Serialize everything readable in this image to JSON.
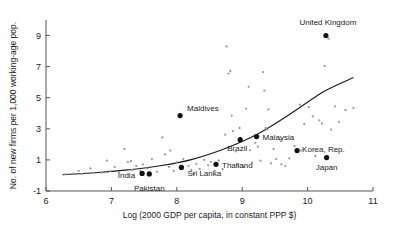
{
  "chart_data": {
    "type": "scatter",
    "title": "",
    "xlabel": "Log (2000 GDP per capita, in constant PPP $)",
    "ylabel": "No. of new firms per 1,000 working-age pop.",
    "xlim": [
      6,
      11
    ],
    "ylim": [
      -1,
      10
    ],
    "xticks": [
      6,
      7,
      8,
      9,
      10,
      11
    ],
    "yticks": [
      -1,
      1,
      3,
      5,
      7,
      9
    ],
    "xtick_labels": [
      "6",
      "7",
      "8",
      "9",
      "10",
      "11"
    ],
    "ytick_labels": [
      "-1",
      "1",
      "3",
      "5",
      "7",
      "9"
    ],
    "grid": false,
    "legend": "none",
    "labeled_points": [
      {
        "name": "United Kingdom",
        "x": 10.28,
        "y": 9.0,
        "label_dx": 2,
        "label_dy": -11,
        "anchor": "middle"
      },
      {
        "name": "Maldives",
        "x": 8.05,
        "y": 3.85,
        "label_dx": 7,
        "label_dy": -5,
        "anchor": "start"
      },
      {
        "name": "Malaysia",
        "x": 9.22,
        "y": 2.5,
        "label_dx": 6,
        "label_dy": 3,
        "anchor": "start"
      },
      {
        "name": "Brazil",
        "x": 8.97,
        "y": 2.3,
        "label_dx": -3,
        "label_dy": 11,
        "anchor": "middle"
      },
      {
        "name": "Korea, Rep.",
        "x": 9.84,
        "y": 1.6,
        "label_dx": 5,
        "label_dy": 1,
        "anchor": "start"
      },
      {
        "name": "Japan",
        "x": 10.29,
        "y": 1.15,
        "label_dx": 0,
        "label_dy": 12,
        "anchor": "middle"
      },
      {
        "name": "Thailand",
        "x": 8.6,
        "y": 0.72,
        "label_dx": 6,
        "label_dy": 4,
        "anchor": "start"
      },
      {
        "name": "Sri Lanka",
        "x": 8.07,
        "y": 0.52,
        "label_dx": 6,
        "label_dy": 9,
        "anchor": "start"
      },
      {
        "name": "India",
        "x": 7.47,
        "y": 0.13,
        "label_dx": -7,
        "label_dy": 5,
        "anchor": "end"
      },
      {
        "name": "Pakistan",
        "x": 7.58,
        "y": 0.1,
        "label_dx": 0,
        "label_dy": 17,
        "anchor": "middle"
      }
    ],
    "grey_points": [
      {
        "x": 6.3,
        "y": 0.08
      },
      {
        "x": 6.42,
        "y": 0.12
      },
      {
        "x": 6.5,
        "y": 0.3
      },
      {
        "x": 6.55,
        "y": 0.1
      },
      {
        "x": 6.68,
        "y": 0.45
      },
      {
        "x": 6.72,
        "y": 0.15
      },
      {
        "x": 6.85,
        "y": 0.18
      },
      {
        "x": 6.93,
        "y": 0.95
      },
      {
        "x": 6.98,
        "y": 0.28
      },
      {
        "x": 7.05,
        "y": 0.55
      },
      {
        "x": 7.12,
        "y": 0.2
      },
      {
        "x": 7.2,
        "y": 1.7
      },
      {
        "x": 7.25,
        "y": 0.85
      },
      {
        "x": 7.3,
        "y": 0.92
      },
      {
        "x": 7.32,
        "y": 0.35
      },
      {
        "x": 7.38,
        "y": 0.62
      },
      {
        "x": 7.44,
        "y": 0.3
      },
      {
        "x": 7.55,
        "y": 0.45
      },
      {
        "x": 7.62,
        "y": 1.05
      },
      {
        "x": 7.7,
        "y": 0.25
      },
      {
        "x": 7.78,
        "y": 2.45
      },
      {
        "x": 7.82,
        "y": 1.35
      },
      {
        "x": 7.88,
        "y": 0.55
      },
      {
        "x": 7.95,
        "y": 0.3
      },
      {
        "x": 8.0,
        "y": 0.85
      },
      {
        "x": 8.1,
        "y": 1.05
      },
      {
        "x": 8.18,
        "y": 0.6
      },
      {
        "x": 8.22,
        "y": 0.35
      },
      {
        "x": 8.3,
        "y": 0.75
      },
      {
        "x": 8.35,
        "y": 0.42
      },
      {
        "x": 8.42,
        "y": 1.0
      },
      {
        "x": 8.48,
        "y": 0.65
      },
      {
        "x": 8.52,
        "y": 0.88
      },
      {
        "x": 8.58,
        "y": 0.3
      },
      {
        "x": 8.64,
        "y": 0.95
      },
      {
        "x": 8.7,
        "y": 0.4
      },
      {
        "x": 8.74,
        "y": 2.62
      },
      {
        "x": 8.76,
        "y": 8.3
      },
      {
        "x": 8.79,
        "y": 6.55
      },
      {
        "x": 8.82,
        "y": 6.72
      },
      {
        "x": 8.84,
        "y": 3.85
      },
      {
        "x": 8.86,
        "y": 2.85
      },
      {
        "x": 8.9,
        "y": 1.55
      },
      {
        "x": 8.92,
        "y": 0.7
      },
      {
        "x": 8.96,
        "y": 3.05
      },
      {
        "x": 9.02,
        "y": 0.55
      },
      {
        "x": 9.06,
        "y": 4.3
      },
      {
        "x": 9.1,
        "y": 5.7
      },
      {
        "x": 9.12,
        "y": 1.62
      },
      {
        "x": 9.15,
        "y": 0.82
      },
      {
        "x": 9.2,
        "y": 2.1
      },
      {
        "x": 9.24,
        "y": 1.85
      },
      {
        "x": 9.28,
        "y": 0.95
      },
      {
        "x": 9.32,
        "y": 6.65
      },
      {
        "x": 9.34,
        "y": 5.45
      },
      {
        "x": 9.36,
        "y": 3.05
      },
      {
        "x": 9.38,
        "y": 2.95
      },
      {
        "x": 9.4,
        "y": 4.25
      },
      {
        "x": 9.44,
        "y": 0.78
      },
      {
        "x": 9.48,
        "y": 1.7
      },
      {
        "x": 9.52,
        "y": 1.05
      },
      {
        "x": 9.58,
        "y": 2.3
      },
      {
        "x": 9.66,
        "y": 0.6
      },
      {
        "x": 9.72,
        "y": 1.1
      },
      {
        "x": 9.8,
        "y": 1.9
      },
      {
        "x": 9.88,
        "y": 4.55
      },
      {
        "x": 9.95,
        "y": 3.3
      },
      {
        "x": 10.02,
        "y": 4.4
      },
      {
        "x": 10.08,
        "y": 3.8
      },
      {
        "x": 10.12,
        "y": 1.25
      },
      {
        "x": 10.18,
        "y": 3.55
      },
      {
        "x": 10.22,
        "y": 3.35
      },
      {
        "x": 10.26,
        "y": 7.05
      },
      {
        "x": 10.32,
        "y": 8.8
      },
      {
        "x": 10.36,
        "y": 2.95
      },
      {
        "x": 10.42,
        "y": 4.45
      },
      {
        "x": 10.48,
        "y": 3.45
      },
      {
        "x": 10.58,
        "y": 4.2
      },
      {
        "x": 10.7,
        "y": 4.35
      },
      {
        "x": 9.9,
        "y": 1.6
      },
      {
        "x": 9.6,
        "y": 0.72
      },
      {
        "x": 8.26,
        "y": 0.1
      },
      {
        "x": 7.9,
        "y": 1.6
      },
      {
        "x": 7.48,
        "y": 0.72
      }
    ],
    "fit_curve": {
      "description": "fitted exponential trend line",
      "points": [
        {
          "x": 6.25,
          "y": 0.05
        },
        {
          "x": 6.75,
          "y": 0.18
        },
        {
          "x": 7.25,
          "y": 0.36
        },
        {
          "x": 7.75,
          "y": 0.62
        },
        {
          "x": 8.25,
          "y": 1.05
        },
        {
          "x": 8.75,
          "y": 1.75
        },
        {
          "x": 9.25,
          "y": 2.7
        },
        {
          "x": 9.75,
          "y": 4.0
        },
        {
          "x": 10.25,
          "y": 5.4
        },
        {
          "x": 10.7,
          "y": 6.3
        }
      ]
    }
  }
}
